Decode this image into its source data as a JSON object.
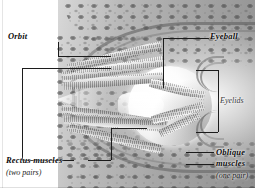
{
  "figure": {
    "style": "grayscale anatomical illustration, cutaway sagittal view",
    "background_color": "#ffffff",
    "ink_color": "#1c1c1c"
  },
  "labels": {
    "orbit": {
      "text": "Orbit",
      "emphasis": "bold-italic"
    },
    "eyeball": {
      "text": "Eyeball",
      "emphasis": "bold-italic"
    },
    "eyelids": {
      "text": "Eyelids",
      "emphasis": "italic"
    },
    "rectus_muscles": {
      "text": "Rectus muscles",
      "qualifier": "(two pairs)",
      "emphasis": "bold-italic"
    },
    "oblique_muscles_line1": "Oblique",
    "oblique_muscles_line2": "muscles",
    "oblique_qualifier": "(one pair)"
  },
  "structures": [
    {
      "name": "orbit",
      "description": "bony socket of spongy and compact bone"
    },
    {
      "name": "eyeball",
      "description": "globe with bright sclera"
    },
    {
      "name": "eyelids",
      "description": "upper and lower palpebral folds"
    },
    {
      "name": "rectus-muscles",
      "description": "four rectus muscles, two pairs"
    },
    {
      "name": "oblique-muscles",
      "description": "two oblique muscles, one pair"
    }
  ]
}
